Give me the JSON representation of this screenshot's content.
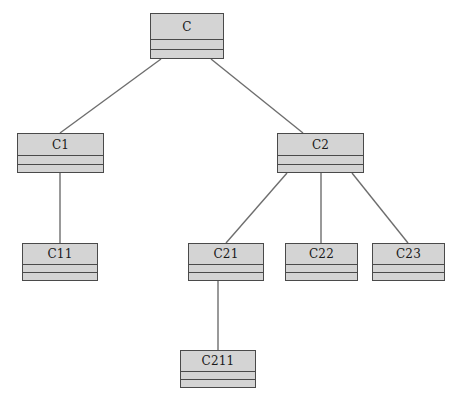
{
  "diagram": {
    "background_color": "#ffffff",
    "node_fill_color": "#d4d4d4",
    "node_border_color": "#4a4a4a",
    "edge_color": "#6e6e6e",
    "label_color": "#1a1a1a"
  },
  "nodes": [
    {
      "id": "C",
      "label": "C",
      "x": 150,
      "y": 13,
      "w": 74,
      "h": 46,
      "name_h": 26,
      "attr_h": 10
    },
    {
      "id": "C1",
      "label": "C1",
      "x": 17,
      "y": 133,
      "w": 87,
      "h": 40,
      "name_h": 22,
      "attr_h": 9
    },
    {
      "id": "C2",
      "label": "C2",
      "x": 277,
      "y": 133,
      "w": 87,
      "h": 40,
      "name_h": 22,
      "attr_h": 9
    },
    {
      "id": "C11",
      "label": "C11",
      "x": 22,
      "y": 243,
      "w": 76,
      "h": 38,
      "name_h": 21,
      "attr_h": 8
    },
    {
      "id": "C21",
      "label": "C21",
      "x": 188,
      "y": 243,
      "w": 76,
      "h": 38,
      "name_h": 21,
      "attr_h": 8
    },
    {
      "id": "C22",
      "label": "C22",
      "x": 285,
      "y": 243,
      "w": 73,
      "h": 38,
      "name_h": 21,
      "attr_h": 8
    },
    {
      "id": "C23",
      "label": "C23",
      "x": 372,
      "y": 243,
      "w": 73,
      "h": 38,
      "name_h": 21,
      "attr_h": 8
    },
    {
      "id": "C211",
      "label": "C211",
      "x": 180,
      "y": 350,
      "w": 76,
      "h": 38,
      "name_h": 21,
      "attr_h": 8
    }
  ],
  "edges": [
    {
      "from": "C",
      "to": "C1",
      "x1": 161,
      "y1": 59,
      "x2": 60,
      "y2": 133
    },
    {
      "from": "C",
      "to": "C2",
      "x1": 211,
      "y1": 59,
      "x2": 303,
      "y2": 133
    },
    {
      "from": "C1",
      "to": "C11",
      "x1": 60,
      "y1": 173,
      "x2": 60,
      "y2": 243
    },
    {
      "from": "C2",
      "to": "C21",
      "x1": 287,
      "y1": 173,
      "x2": 226,
      "y2": 243
    },
    {
      "from": "C2",
      "to": "C22",
      "x1": 321,
      "y1": 173,
      "x2": 321,
      "y2": 243
    },
    {
      "from": "C2",
      "to": "C23",
      "x1": 352,
      "y1": 173,
      "x2": 408,
      "y2": 243
    },
    {
      "from": "C21",
      "to": "C211",
      "x1": 218,
      "y1": 281,
      "x2": 218,
      "y2": 350
    }
  ]
}
